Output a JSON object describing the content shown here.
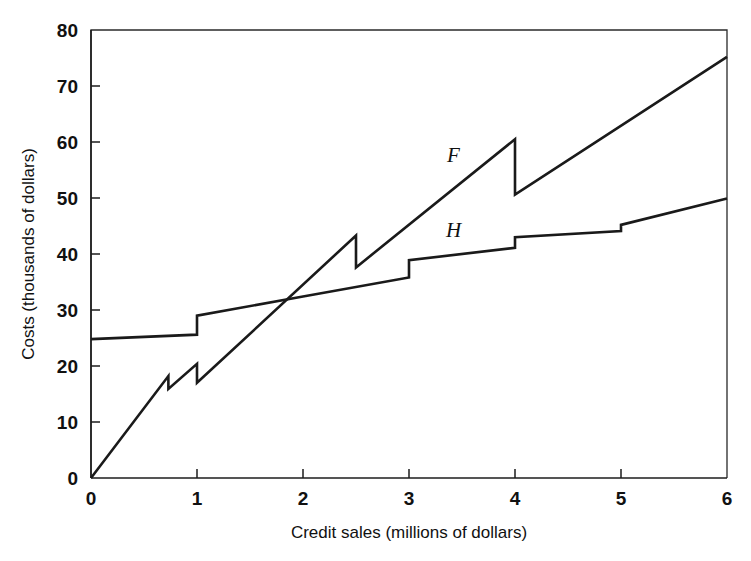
{
  "chart_data": {
    "type": "line",
    "title": "",
    "subtitle": "",
    "xlabel": "Credit sales (millions of dollars)",
    "ylabel": "Costs (thousands of dollars)",
    "xlim": [
      0,
      6
    ],
    "ylim": [
      0,
      80
    ],
    "xticks": [
      0,
      1,
      2,
      3,
      4,
      5,
      6
    ],
    "xtick_labels": [
      "0",
      "1",
      "2",
      "3",
      "4",
      "5",
      "6"
    ],
    "yticks": [
      0,
      10,
      20,
      30,
      40,
      50,
      60,
      70,
      80
    ],
    "ytick_labels": [
      "0",
      "10",
      "20",
      "30",
      "40",
      "50",
      "60",
      "70",
      "80"
    ],
    "grid": false,
    "legend_position": "inline-annotation",
    "line_color": "#1a1a1a",
    "series": [
      {
        "name": "F",
        "label": "F",
        "label_x": 3.42,
        "label_y": 56.5,
        "description": "Factoring cost: steeply rising sawtooth line starting at origin, with small drops near 0.73 and 1.0, a larger drop at 2.5 and a large drop at 4.0",
        "points": [
          {
            "x": 0.0,
            "y": 0.0
          },
          {
            "x": 0.73,
            "y": 18.2
          },
          {
            "x": 0.73,
            "y": 15.9
          },
          {
            "x": 1.0,
            "y": 20.4
          },
          {
            "x": 1.0,
            "y": 17.0
          },
          {
            "x": 2.5,
            "y": 43.3
          },
          {
            "x": 2.5,
            "y": 37.6
          },
          {
            "x": 4.0,
            "y": 60.5
          },
          {
            "x": 4.0,
            "y": 50.6
          },
          {
            "x": 6.0,
            "y": 75.2
          }
        ]
      },
      {
        "name": "H",
        "label": "H",
        "label_x": 3.42,
        "label_y": 43.0,
        "description": "In-house cost: shallow rising step function starting near 24.8 with upward jumps at 1, 3, 4 and 5",
        "points": [
          {
            "x": 0.0,
            "y": 24.8
          },
          {
            "x": 1.0,
            "y": 25.6
          },
          {
            "x": 1.0,
            "y": 29.0
          },
          {
            "x": 2.0,
            "y": 32.4
          },
          {
            "x": 3.0,
            "y": 35.8
          },
          {
            "x": 3.0,
            "y": 38.9
          },
          {
            "x": 4.0,
            "y": 41.1
          },
          {
            "x": 4.0,
            "y": 43.0
          },
          {
            "x": 5.0,
            "y": 44.1
          },
          {
            "x": 5.0,
            "y": 45.2
          },
          {
            "x": 6.0,
            "y": 49.9
          }
        ]
      }
    ],
    "annotations": [
      {
        "text": "F",
        "x": 3.42,
        "y": 56.5
      },
      {
        "text": "H",
        "x": 3.42,
        "y": 43.0
      }
    ]
  }
}
